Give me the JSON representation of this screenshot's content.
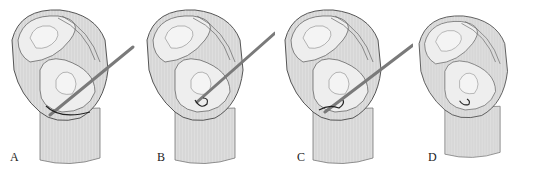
{
  "figure": {
    "panels": [
      {
        "label": "A",
        "x": 0,
        "label_x": 10,
        "needle": true,
        "suture": "hook"
      },
      {
        "label": "B",
        "x": 135,
        "label_x": 157,
        "needle": true,
        "suture": "loop"
      },
      {
        "label": "C",
        "x": 273,
        "label_x": 297,
        "needle": true,
        "suture": "loop"
      },
      {
        "label": "D",
        "x": 408,
        "label_x": 428,
        "needle": false,
        "suture": "knot"
      }
    ],
    "colors": {
      "bone_fill": "#d9d9d9",
      "bone_stroke": "#555555",
      "surface_fill": "#eeeeee",
      "needle": "#7a7a7a",
      "suture": "#222222"
    }
  }
}
